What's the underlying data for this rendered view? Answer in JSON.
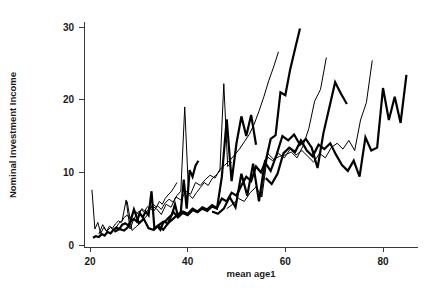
{
  "chart_data": {
    "type": "line",
    "title": "",
    "xlabel": "mean age1",
    "ylabel": "Nominal Investment Income",
    "xlim": [
      18,
      87
    ],
    "ylim": [
      0,
      31
    ],
    "xticks": [
      20,
      40,
      60,
      80
    ],
    "yticks": [
      0,
      10,
      20,
      30
    ],
    "grid": false,
    "legend": "none",
    "series": [
      {
        "name": "cohort-1",
        "weight": "thin",
        "x": [
          20.4,
          21.0,
          21.6,
          22.2,
          22.8,
          23.4,
          24.0,
          24.6,
          25.2,
          25.8,
          26.4,
          27.0,
          27.6,
          28.2,
          28.8,
          29.4,
          30.0,
          30.6,
          31.2,
          31.8,
          32.4,
          33.0,
          33.6,
          34.2,
          34.8,
          35.4,
          36.0,
          36.6,
          37.2,
          37.8
        ],
        "y": [
          7.6,
          2.2,
          3.1,
          1.6,
          2.4,
          1.9,
          2.6,
          2.3,
          2.9,
          3.3,
          3.1,
          3.8,
          4.1,
          3.6,
          4.4,
          4.6,
          4.2,
          5.0,
          4.7,
          5.3,
          5.0,
          5.6,
          5.2,
          6.0,
          5.6,
          6.4,
          6.9,
          7.3,
          7.9,
          8.6
        ]
      },
      {
        "name": "cohort-2",
        "weight": "thick",
        "x": [
          20.6,
          21.2,
          21.8,
          22.4,
          23.0,
          23.6,
          24.2,
          24.8,
          25.4,
          26.0,
          26.6,
          27.2,
          27.8,
          28.4,
          29.0,
          29.6,
          30.2,
          30.8,
          31.4,
          32.0,
          32.6,
          33.2,
          33.8,
          34.4,
          35.0,
          35.6,
          36.2,
          36.8,
          37.4,
          38.0,
          38.6,
          39.2,
          39.8,
          40.4,
          41.0,
          41.6,
          42.2
        ],
        "y": [
          1.0,
          1.2,
          1.1,
          1.5,
          1.3,
          1.8,
          1.6,
          2.1,
          2.4,
          2.2,
          2.8,
          3.0,
          2.7,
          3.3,
          3.6,
          3.2,
          4.4,
          3.8,
          4.6,
          4.1,
          7.4,
          2.2,
          2.6,
          2.1,
          3.1,
          3.4,
          3.8,
          4.2,
          5.6,
          4.0,
          4.6,
          9.0,
          5.0,
          10.3,
          9.4,
          10.9,
          11.6
        ]
      },
      {
        "name": "cohort-3",
        "weight": "thin",
        "x": [
          21.8,
          22.6,
          23.4,
          24.2,
          25.0,
          25.8,
          26.6,
          27.4,
          28.2,
          29.0,
          29.8,
          30.6,
          31.4,
          32.2,
          33.0,
          33.8,
          34.6,
          35.4,
          36.2,
          37.0,
          37.8,
          38.6,
          39.4,
          40.2,
          41.0,
          41.8,
          42.6,
          43.4,
          44.2,
          45.0,
          45.8,
          46.6,
          47.4,
          48.2,
          49.0
        ],
        "y": [
          1.5,
          2.8,
          1.9,
          2.4,
          2.0,
          2.9,
          3.4,
          6.2,
          2.2,
          3.6,
          4.5,
          4.8,
          4.3,
          5.2,
          4.6,
          5.4,
          4.9,
          5.8,
          6.3,
          5.9,
          6.8,
          7.4,
          19.0,
          7.0,
          6.4,
          7.2,
          7.9,
          8.6,
          8.2,
          9.1,
          9.6,
          10.2,
          22.2,
          10.8,
          11.4
        ]
      },
      {
        "name": "cohort-4",
        "weight": "thick",
        "x": [
          25.0,
          26.0,
          27.0,
          28.0,
          29.0,
          30.0,
          31.0,
          32.0,
          33.0,
          34.0,
          35.0,
          36.0,
          37.0,
          38.0,
          39.0,
          40.0,
          41.0,
          42.0,
          43.0,
          44.0,
          45.0,
          46.0,
          47.0,
          48.0,
          49.0,
          50.0,
          51.0,
          52.0,
          53.0,
          54.0
        ],
        "y": [
          1.8,
          2.2,
          2.0,
          2.6,
          4.9,
          3.0,
          3.6,
          2.3,
          2.1,
          2.7,
          3.2,
          3.0,
          4.6,
          3.8,
          4.4,
          4.1,
          4.8,
          4.5,
          5.0,
          4.7,
          5.3,
          5.0,
          9.4,
          17.3,
          8.8,
          14.0,
          17.7,
          15.0,
          17.9,
          13.8
        ]
      },
      {
        "name": "cohort-5",
        "weight": "thin",
        "x": [
          27.6,
          28.6,
          29.6,
          30.6,
          31.6,
          32.6,
          33.6,
          34.6,
          35.6,
          36.6,
          37.6,
          38.6,
          39.6,
          40.6,
          41.6,
          42.6,
          43.6,
          44.6,
          45.6,
          46.6,
          47.6,
          48.6,
          49.6,
          50.6,
          51.6,
          52.6,
          53.6,
          54.6,
          55.6,
          56.6,
          57.6,
          58.6
        ],
        "y": [
          6.0,
          2.0,
          2.6,
          3.2,
          4.0,
          5.4,
          5.0,
          4.2,
          5.6,
          5.2,
          6.6,
          6.2,
          7.4,
          7.0,
          8.6,
          8.2,
          9.0,
          9.6,
          9.2,
          10.4,
          11.0,
          11.6,
          12.4,
          13.2,
          14.2,
          15.2,
          16.6,
          18.4,
          20.4,
          22.6,
          24.5,
          26.6
        ]
      },
      {
        "name": "cohort-6",
        "weight": "thick",
        "x": [
          33.0,
          34.0,
          35.0,
          36.0,
          37.0,
          38.0,
          39.0,
          40.0,
          41.0,
          42.0,
          43.0,
          44.0,
          45.0,
          46.0,
          47.0,
          48.0,
          49.0,
          50.0,
          51.0,
          52.0,
          53.0,
          54.0,
          55.0,
          56.0,
          57.0,
          58.0,
          59.0,
          60.0,
          61.0,
          62.0,
          63.0
        ],
        "y": [
          2.2,
          2.6,
          2.1,
          3.0,
          3.6,
          4.2,
          4.6,
          4.3,
          5.0,
          4.6,
          5.2,
          4.9,
          5.5,
          5.1,
          6.4,
          6.0,
          7.2,
          6.8,
          8.2,
          9.4,
          8.8,
          10.8,
          10.0,
          11.6,
          14.6,
          15.1,
          21.0,
          20.6,
          24.2,
          27.0,
          29.8
        ]
      },
      {
        "name": "cohort-7",
        "weight": "thick",
        "x": [
          45.0,
          46.2,
          47.4,
          48.6,
          49.8,
          51.0,
          52.2,
          53.4,
          54.6,
          55.8,
          57.0,
          58.2,
          59.4,
          60.6,
          61.8,
          63.0,
          64.2,
          65.4,
          66.6,
          67.8,
          69.0,
          70.2,
          71.4,
          72.6
        ],
        "y": [
          4.6,
          4.3,
          5.0,
          6.6,
          5.2,
          9.8,
          6.8,
          11.2,
          6.0,
          11.4,
          10.2,
          12.4,
          15.0,
          14.4,
          15.2,
          13.8,
          14.6,
          13.4,
          10.6,
          15.4,
          18.9,
          22.4,
          20.8,
          19.4
        ]
      },
      {
        "name": "cohort-8",
        "weight": "thin",
        "x": [
          48.0,
          49.2,
          50.4,
          51.6,
          52.8,
          54.0,
          55.2,
          56.4,
          57.6,
          58.8,
          60.0,
          61.2,
          62.4,
          63.6,
          64.8,
          66.0,
          67.2,
          68.4
        ],
        "y": [
          5.0,
          5.6,
          6.4,
          6.0,
          7.2,
          8.0,
          6.6,
          12.6,
          11.8,
          12.2,
          12.4,
          12.8,
          12.0,
          13.6,
          16.0,
          19.8,
          21.4,
          25.8
        ]
      },
      {
        "name": "cohort-9",
        "weight": "thin",
        "x": [
          55.0,
          56.2,
          57.4,
          58.6,
          59.8,
          61.0,
          62.2,
          63.4,
          64.6,
          65.8,
          67.0,
          68.2,
          69.4,
          70.6,
          71.8,
          73.0,
          74.2,
          75.4,
          76.6,
          77.8
        ],
        "y": [
          6.6,
          12.2,
          11.6,
          12.6,
          12.0,
          13.2,
          12.4,
          13.0,
          12.2,
          11.4,
          12.6,
          12.0,
          13.4,
          14.0,
          13.2,
          14.4,
          13.0,
          17.2,
          19.6,
          25.4
        ]
      },
      {
        "name": "cohort-10",
        "weight": "thick",
        "x": [
          56.0,
          57.2,
          58.4,
          59.6,
          60.8,
          62.0,
          63.2,
          64.4,
          65.6,
          66.8,
          68.0,
          69.2,
          70.4,
          71.6,
          72.8,
          74.0,
          75.2,
          76.4,
          77.6,
          78.8,
          80.0,
          81.2,
          82.4,
          83.6,
          84.8
        ],
        "y": [
          9.2,
          8.4,
          9.8,
          12.6,
          13.4,
          12.8,
          14.4,
          13.0,
          12.2,
          13.8,
          13.2,
          14.0,
          12.4,
          11.0,
          10.2,
          11.6,
          9.4,
          14.8,
          13.0,
          13.4,
          21.6,
          17.2,
          20.4,
          16.8,
          23.4
        ]
      }
    ]
  },
  "axes": {
    "x_tick_labels": [
      "20",
      "40",
      "60",
      "80"
    ],
    "y_tick_labels": [
      "0",
      "10",
      "20",
      "30"
    ],
    "x_title": "mean age1",
    "y_title": "Nominal Investment Income"
  }
}
